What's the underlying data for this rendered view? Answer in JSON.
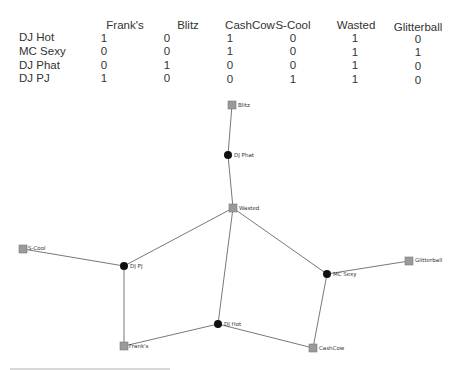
{
  "matrix": {
    "columns": [
      "Frank's",
      "Blitz",
      "CashCow",
      "S-Cool",
      "Wasted",
      "Glitterball"
    ],
    "rows": [
      {
        "label": "DJ Hot",
        "values": [
          "1",
          "0",
          "1",
          "0",
          "1",
          "0"
        ]
      },
      {
        "label": "MC Sexy",
        "values": [
          "0",
          "0",
          "1",
          "0",
          "1",
          "1"
        ]
      },
      {
        "label": "DJ Phat",
        "values": [
          "0",
          "1",
          "0",
          "0",
          "1",
          "0"
        ]
      },
      {
        "label": "DJ PJ",
        "values": [
          "1",
          "0",
          "0",
          "1",
          "1",
          "0"
        ]
      }
    ]
  },
  "graph": {
    "colors": {
      "person": "#111111",
      "venue_fill": "#9a9a9a",
      "venue_stroke": "#7a7a7a",
      "edge": "#555555"
    },
    "nodes": [
      {
        "id": "blitz",
        "label": "Blitz",
        "type": "venue",
        "x": 232,
        "y": 105
      },
      {
        "id": "djphat",
        "label": "DJ Phat",
        "type": "person",
        "x": 228,
        "y": 155
      },
      {
        "id": "wasted",
        "label": "Wasted",
        "type": "venue",
        "x": 233,
        "y": 208
      },
      {
        "id": "scool",
        "label": "S-Cool",
        "type": "venue",
        "x": 23,
        "y": 249
      },
      {
        "id": "djpj",
        "label": "DJ PJ",
        "type": "person",
        "x": 124,
        "y": 266
      },
      {
        "id": "mcsexy",
        "label": "MC Sexy",
        "type": "person",
        "x": 327,
        "y": 274
      },
      {
        "id": "glitterball",
        "label": "Glitterball",
        "type": "venue",
        "x": 409,
        "y": 261
      },
      {
        "id": "djhot",
        "label": "DJ Hot",
        "type": "person",
        "x": 218,
        "y": 324
      },
      {
        "id": "franks",
        "label": "Frank's",
        "type": "venue",
        "x": 124,
        "y": 346
      },
      {
        "id": "cashcow",
        "label": "CashCow",
        "type": "venue",
        "x": 313,
        "y": 348
      }
    ]
  },
  "caption": {
    "text": ""
  }
}
